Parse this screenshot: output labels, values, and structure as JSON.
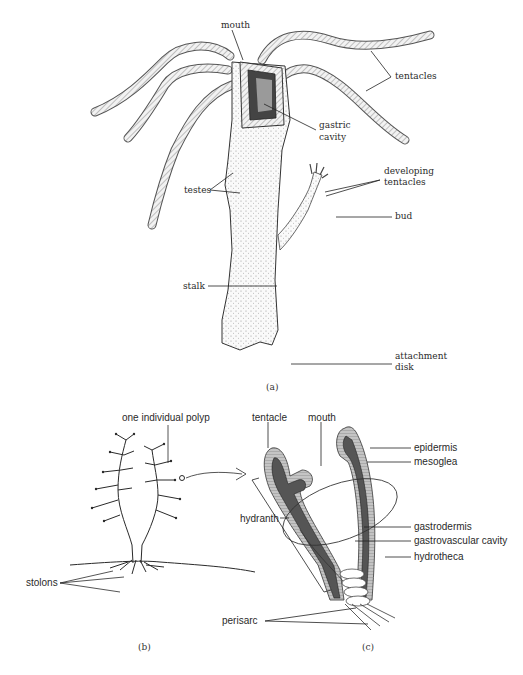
{
  "figure": {
    "panel_a": {
      "caption": "(a)",
      "labels": {
        "mouth": "mouth",
        "tentacles": "tentacles",
        "gastric_cavity_1": "gastric",
        "gastric_cavity_2": "cavity",
        "developing_tentacles_1": "developing",
        "developing_tentacles_2": "tentacles",
        "testes": "testes",
        "bud": "bud",
        "stalk": "stalk",
        "attachment_disk_1": "attachment",
        "attachment_disk_2": "disk"
      }
    },
    "panel_b": {
      "caption": "(b)",
      "labels": {
        "polyp": "one individual polyp",
        "stolons": "stolons"
      }
    },
    "panel_c": {
      "caption": "(c)",
      "labels": {
        "tentacle": "tentacle",
        "mouth": "mouth",
        "epidermis": "epidermis",
        "mesoglea": "mesoglea",
        "hydranth": "hydranth",
        "gastrodermis": "gastrodermis",
        "gastrovascular_cavity": "gastrovascular cavity",
        "hydrotheca": "hydrotheca",
        "perisarc": "perisarc"
      }
    },
    "colors": {
      "ink": "#2a2a2a",
      "epidermis_fill": "#b8b8b8",
      "gastrodermis_fill": "#5a5a5a",
      "cavity_fill": "#ffffff"
    }
  }
}
